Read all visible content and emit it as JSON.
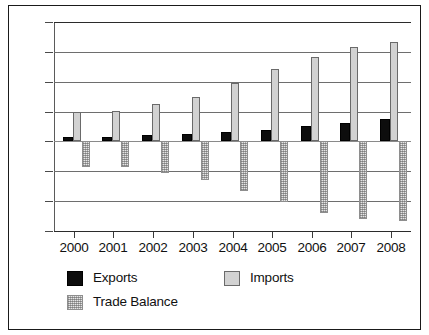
{
  "chart_data": {
    "type": "bar",
    "title": "",
    "xlabel": "",
    "ylabel": "",
    "categories": [
      "2000",
      "2001",
      "2002",
      "2003",
      "2004",
      "2005",
      "2006",
      "2007",
      "2008"
    ],
    "series": [
      {
        "name": "Exports",
        "values": [
          14,
          16,
          20,
          26,
          30,
          38,
          51,
          62,
          76
        ]
      },
      {
        "name": "Imports",
        "values": [
          99,
          102,
          126,
          150,
          196,
          241,
          283,
          315,
          333
        ]
      },
      {
        "name": "Trade Balance",
        "values": [
          -85,
          -86,
          -106,
          -130,
          -167,
          -204,
          -239,
          -260,
          -267
        ]
      }
    ],
    "ylim": [
      -300,
      400
    ],
    "yticks": [
      400,
      300,
      200,
      100,
      0,
      -100,
      -200,
      -300
    ],
    "ytick_labels": [
      "400",
      "300",
      "200",
      "100",
      "0",
      "-100",
      "-200",
      "-300"
    ],
    "grid": true,
    "legend_position": "bottom",
    "colors": {
      "exports": "#0d0d0d",
      "imports": "#d2d2d2",
      "trade_balance": "#e6e6e6",
      "axis": "#2b2b2b",
      "gridline": "#6e6e6e",
      "text": "#111111",
      "background": "#ffffff",
      "frame": "#1a1a1a"
    }
  },
  "legend": {
    "items": [
      {
        "label": "Exports",
        "swatch": "exports"
      },
      {
        "label": "Imports",
        "swatch": "imports"
      },
      {
        "label": "Trade Balance",
        "swatch": "balance"
      }
    ]
  }
}
